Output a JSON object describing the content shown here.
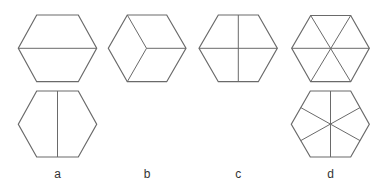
{
  "diagram": {
    "line_color": "#6a6a6a",
    "label_color": "#333333",
    "figures": [
      {
        "id": "a-top",
        "group": "a",
        "division": "horizontal line joining opposite vertices (2 trapezoids)",
        "hexagon": [
          [
            36.7,
            15
          ],
          [
            78.3,
            15
          ],
          [
            96.7,
            48.3
          ],
          [
            78.3,
            81.7
          ],
          [
            36.7,
            81.7
          ],
          [
            18.3,
            48.3
          ]
        ],
        "lines": [
          [
            18.3,
            48.3,
            96.7,
            48.3
          ]
        ]
      },
      {
        "id": "a-bottom",
        "group": "a",
        "division": "vertical line joining midpoints of top and bottom edges (2 pentagons)",
        "hexagon": [
          [
            36.7,
            91
          ],
          [
            78.3,
            91
          ],
          [
            96.7,
            124.3
          ],
          [
            78.3,
            157
          ],
          [
            36.7,
            157
          ],
          [
            18.3,
            124.3
          ]
        ],
        "lines": [
          [
            57.5,
            91,
            57.5,
            157
          ]
        ]
      },
      {
        "id": "b-top",
        "group": "b",
        "division": "three lines from centre to alternate vertices (3 rhombuses, cube view)",
        "hexagon": [
          [
            127.3,
            15
          ],
          [
            166.7,
            15
          ],
          [
            186,
            48.3
          ],
          [
            166.7,
            81.7
          ],
          [
            127.3,
            81.7
          ],
          [
            108.3,
            48.3
          ]
        ],
        "lines": [
          [
            146.5,
            48.3,
            127.3,
            15
          ],
          [
            146.5,
            48.3,
            127.3,
            81.7
          ],
          [
            146.5,
            48.3,
            186,
            48.3
          ]
        ]
      },
      {
        "id": "c-top",
        "group": "c",
        "division": "horizontal and vertical lines through centre (4 parts)",
        "hexagon": [
          [
            218.3,
            15
          ],
          [
            258.3,
            15
          ],
          [
            277.3,
            48.3
          ],
          [
            258.3,
            81.7
          ],
          [
            218.3,
            81.7
          ],
          [
            199,
            48.3
          ]
        ],
        "lines": [
          [
            199,
            48.3,
            277.3,
            48.3
          ],
          [
            238.3,
            15,
            238.3,
            81.7
          ]
        ]
      },
      {
        "id": "d-top",
        "group": "d",
        "division": "three diagonals through centre (6 triangles)",
        "hexagon": [
          [
            310.7,
            15.5
          ],
          [
            350.7,
            15.5
          ],
          [
            369.3,
            48.3
          ],
          [
            350.7,
            81.7
          ],
          [
            310.7,
            81.7
          ],
          [
            291.7,
            48.3
          ]
        ],
        "lines": [
          [
            291.7,
            48.3,
            369.3,
            48.3
          ],
          [
            310.7,
            15.5,
            350.7,
            81.7
          ],
          [
            350.7,
            15.5,
            310.7,
            81.7
          ]
        ]
      },
      {
        "id": "d-bottom",
        "group": "d",
        "division": "three lines joining midpoints of opposite edges through centre (6 kites)",
        "hexagon": [
          [
            310.3,
            91
          ],
          [
            350.7,
            91
          ],
          [
            369.3,
            124.3
          ],
          [
            350.7,
            157
          ],
          [
            310.3,
            157
          ],
          [
            291.3,
            124.3
          ]
        ],
        "lines": [
          [
            330.5,
            91,
            330.5,
            157
          ],
          [
            300.8,
            107.6,
            360,
            140.6
          ],
          [
            360,
            107.6,
            300.8,
            140.6
          ]
        ]
      }
    ],
    "labels": [
      {
        "text": "a",
        "x": 57.5,
        "y": 178
      },
      {
        "text": "b",
        "x": 147,
        "y": 178
      },
      {
        "text": "c",
        "x": 238.3,
        "y": 178
      },
      {
        "text": "d",
        "x": 330.5,
        "y": 178
      }
    ]
  }
}
